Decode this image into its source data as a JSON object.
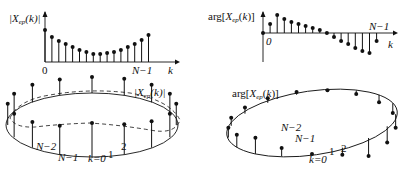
{
  "panels": {
    "magnitude_stem": {
      "y_label": "|X_ep(k)|",
      "x_label": "k",
      "tick_start": "0",
      "tick_end": "N−1"
    },
    "phase_stem": {
      "y_label": "arg[X_ep(k)]",
      "x_label": "k",
      "tick_start": "0",
      "tick_end": "N−1"
    },
    "magnitude_circle": {
      "label": "|X_ep(k)|",
      "points": [
        "N−2",
        "N−1",
        "k=0",
        "1",
        "2"
      ]
    },
    "phase_circle": {
      "label": "arg[X_ep(k)]",
      "points": [
        "N−2",
        "N−1",
        "k=0",
        "1",
        "2"
      ]
    }
  },
  "chart_data": [
    {
      "type": "stem",
      "title": "|X_ep(k)|",
      "xlabel": "k",
      "ylabel": "|X_ep(k)|",
      "x": [
        0,
        1,
        2,
        3,
        4,
        5,
        6,
        7,
        8,
        9,
        10,
        11,
        12,
        13,
        14,
        15
      ],
      "values": [
        32,
        25,
        21,
        18,
        15,
        12,
        10,
        8,
        8,
        9,
        10,
        12,
        15,
        18,
        22,
        27
      ]
    },
    {
      "type": "stem",
      "title": "arg[X_ep(k)]",
      "xlabel": "k",
      "ylabel": "arg[X_ep(k)]",
      "x": [
        0,
        1,
        2,
        3,
        4,
        5,
        6,
        7,
        8,
        9,
        10,
        11,
        12,
        13,
        14,
        15,
        16
      ],
      "values": [
        0,
        9,
        18,
        14,
        11,
        9,
        7,
        5,
        3,
        0,
        -4,
        -8,
        -11,
        -15,
        -18,
        -20,
        -8
      ]
    }
  ]
}
